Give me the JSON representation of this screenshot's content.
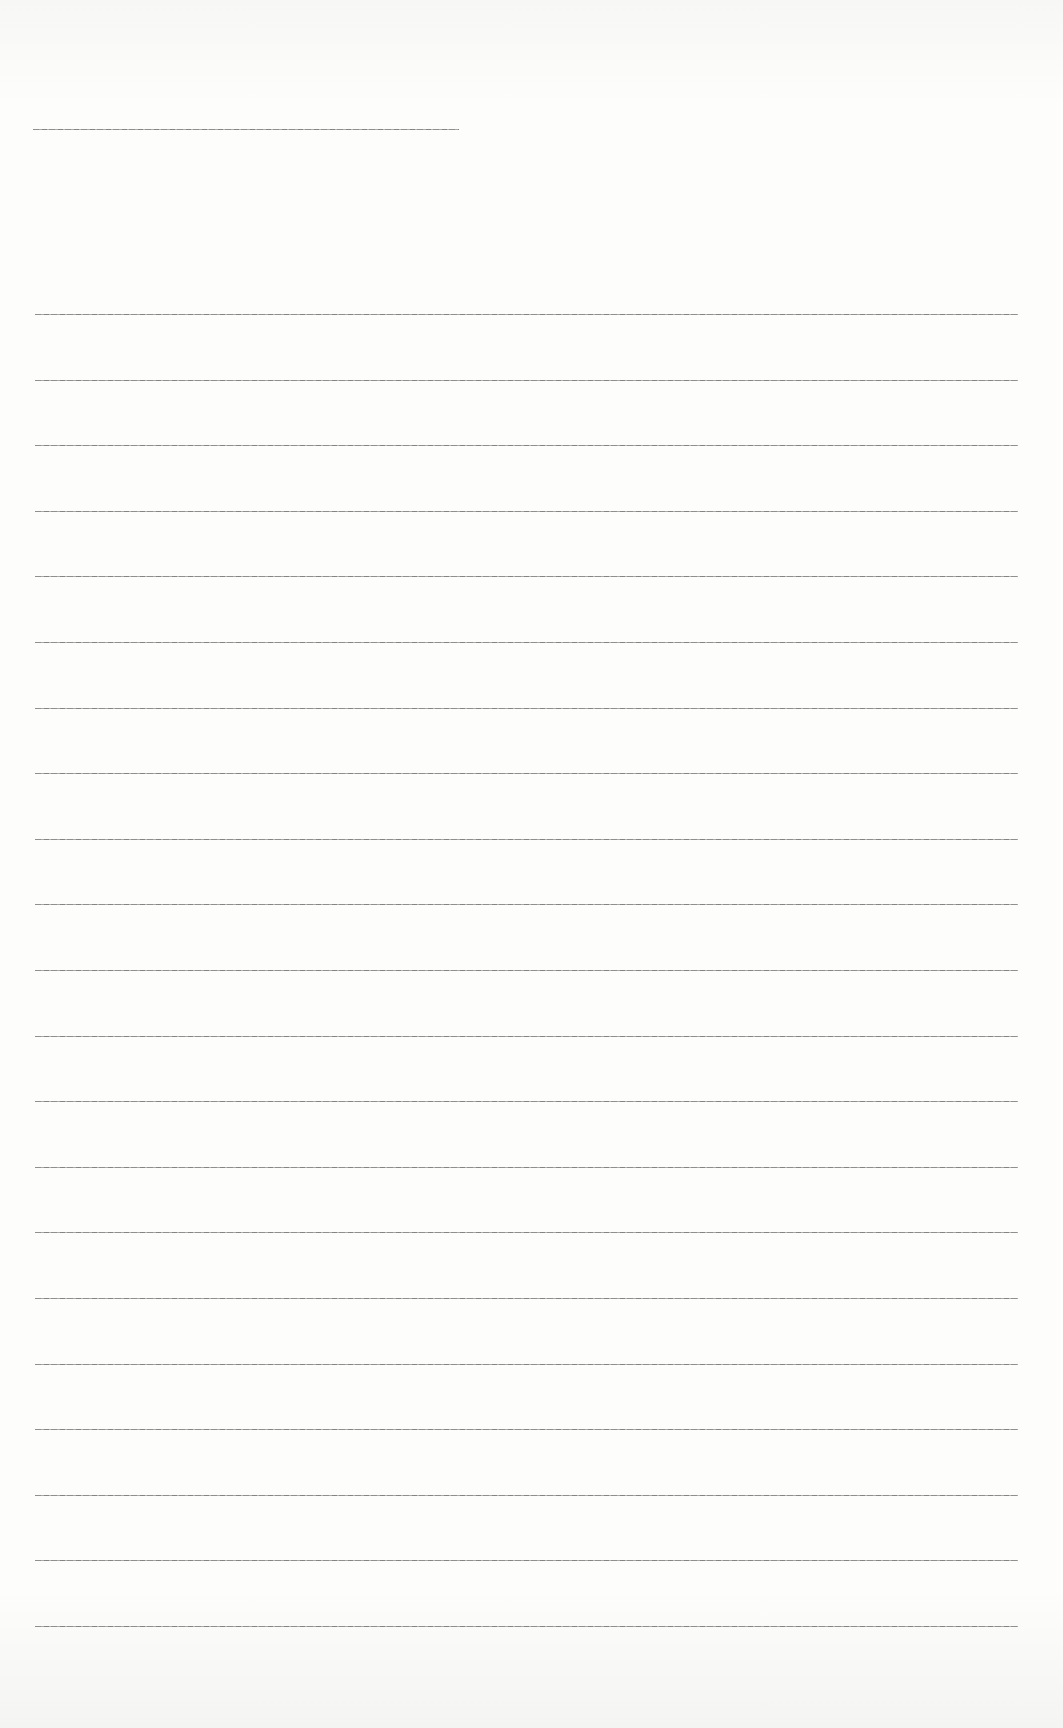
{
  "document": {
    "type": "ruled-writing-sheet",
    "header_line": {
      "filled_text": ""
    },
    "ruled_lines": [
      {
        "index": 1,
        "filled_text": ""
      },
      {
        "index": 2,
        "filled_text": ""
      },
      {
        "index": 3,
        "filled_text": ""
      },
      {
        "index": 4,
        "filled_text": ""
      },
      {
        "index": 5,
        "filled_text": ""
      },
      {
        "index": 6,
        "filled_text": ""
      },
      {
        "index": 7,
        "filled_text": ""
      },
      {
        "index": 8,
        "filled_text": ""
      },
      {
        "index": 9,
        "filled_text": ""
      },
      {
        "index": 10,
        "filled_text": ""
      },
      {
        "index": 11,
        "filled_text": ""
      },
      {
        "index": 12,
        "filled_text": ""
      },
      {
        "index": 13,
        "filled_text": ""
      },
      {
        "index": 14,
        "filled_text": ""
      },
      {
        "index": 15,
        "filled_text": ""
      },
      {
        "index": 16,
        "filled_text": ""
      },
      {
        "index": 17,
        "filled_text": ""
      },
      {
        "index": 18,
        "filled_text": ""
      },
      {
        "index": 19,
        "filled_text": ""
      },
      {
        "index": 20,
        "filled_text": ""
      },
      {
        "index": 21,
        "filled_text": ""
      }
    ],
    "line_count": 21,
    "colors": {
      "paper": "#fbfbfa",
      "rule": "#7c7c7c"
    }
  }
}
